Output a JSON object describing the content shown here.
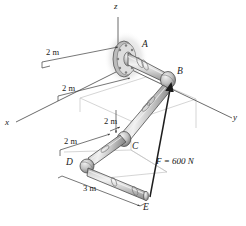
{
  "figure": {
    "kind": "engineering-statics-diagram",
    "colors": {
      "pipe_light": "#e8e8e8",
      "pipe_mid": "#b9b9b9",
      "pipe_dark": "#8a8a8a",
      "outline": "#4a4a4a",
      "construction": "#bdbdbd",
      "axis": "#555555",
      "text": "#1a1a1a",
      "wall_shadow": "#d2d2d2"
    }
  },
  "axes": [
    {
      "name": "z-axis",
      "label": "z"
    },
    {
      "name": "x-axis",
      "label": "x"
    },
    {
      "name": "y-axis",
      "label": "y"
    }
  ],
  "points": [
    {
      "name": "point-a",
      "label": "A"
    },
    {
      "name": "point-b",
      "label": "B"
    },
    {
      "name": "point-c",
      "label": "C"
    },
    {
      "name": "point-d",
      "label": "D"
    },
    {
      "name": "point-e",
      "label": "E"
    }
  ],
  "dimensions": [
    {
      "name": "dim-ab-upper",
      "label": "2 m"
    },
    {
      "name": "dim-depth",
      "label": "2 m"
    },
    {
      "name": "dim-vertical",
      "label": "2 m"
    },
    {
      "name": "dim-cd",
      "label": "2 m"
    },
    {
      "name": "dim-de",
      "label": "3 m"
    }
  ],
  "force": {
    "name": "applied-force",
    "label": "F = 600 N",
    "magnitude": 600,
    "unit": "N",
    "symbol": "F",
    "from": "E",
    "to": "B"
  }
}
